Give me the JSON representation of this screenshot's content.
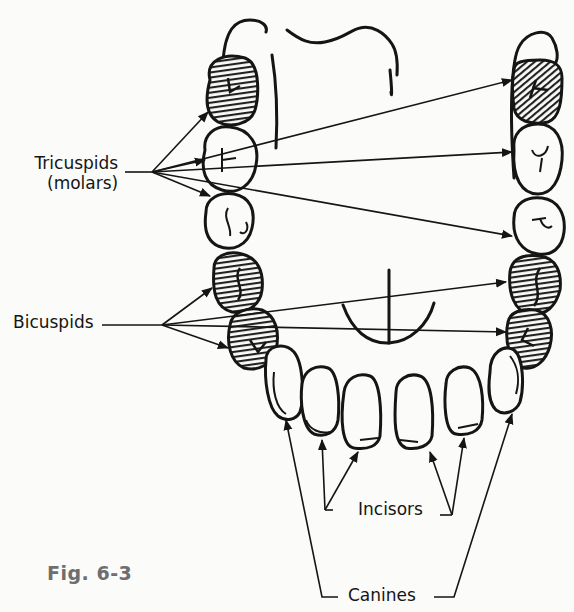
{
  "figure": {
    "caption": "Fig. 6-3"
  },
  "labels": {
    "tricuspids_line1": "Tricuspids",
    "tricuspids_line2": "(molars)",
    "bicuspids": "Bicuspids",
    "incisors": "Incisors",
    "canines": "Canines"
  },
  "colors": {
    "ink": "#151515",
    "paper": "#fbfbf9",
    "caption": "#6e6e6e"
  },
  "groups": [
    {
      "name": "Tricuspids (molars)",
      "shaded": [
        "top-left",
        "top-right"
      ],
      "arrows": 6
    },
    {
      "name": "Bicuspids",
      "shaded": true,
      "arrows": 5
    },
    {
      "name": "Incisors",
      "arrows": 4
    },
    {
      "name": "Canines",
      "arrows": 2
    }
  ]
}
